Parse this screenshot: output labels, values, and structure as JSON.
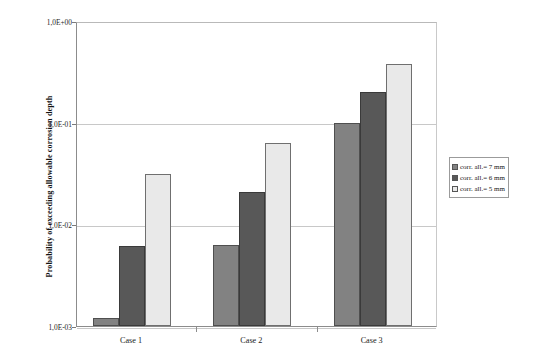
{
  "chart_data": {
    "type": "bar",
    "title": "",
    "subtitle": "",
    "xlabel": "",
    "ylabel": "Probability of exceeding allowable corrosion depth",
    "categories": [
      "Case 1",
      "Case 2",
      "Case 3"
    ],
    "series": [
      {
        "name": "corr. all.= 7 mm",
        "color": "#828282",
        "values": [
          0.0012,
          0.0062,
          0.1
        ]
      },
      {
        "name": "corr. all.= 6 mm",
        "color": "#585858",
        "values": [
          0.0061,
          0.021,
          0.2
        ]
      },
      {
        "name": "corr. all.= 5 mm",
        "color": "#e9e9e9",
        "values": [
          0.031,
          0.063,
          0.38
        ]
      }
    ],
    "yscale": "log",
    "ylim": [
      0.001,
      1
    ],
    "ytick_labels": [
      "1,0E+00",
      "1,0E-01",
      "1,0E-02",
      "1,0E-03"
    ],
    "ytick_values": [
      1,
      0.1,
      0.01,
      0.001
    ],
    "grid": true,
    "legend_position": "right"
  },
  "legend": {
    "items": [
      {
        "label": "corr. all.= 7 mm"
      },
      {
        "label": "corr. all.= 6 mm"
      },
      {
        "label": "corr. all.= 5 mm"
      }
    ]
  }
}
